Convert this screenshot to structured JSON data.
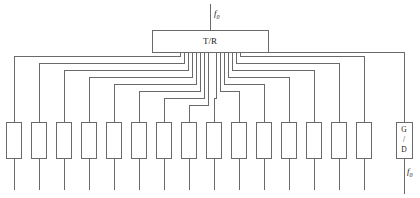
{
  "diagram": {
    "type": "block-diagram",
    "canvas": {
      "width": 420,
      "height": 198
    },
    "colors": {
      "line": "#6a6a6a",
      "box_fill": "#ffffff",
      "text": "#1a1a1a",
      "background": "#ffffff"
    }
  },
  "tr_module": {
    "label": "T/R",
    "x": 152,
    "y": 30,
    "width": 116,
    "height": 22
  },
  "input_port": {
    "label_base": "f",
    "label_sub": "0",
    "stem_x": 210,
    "stem_top": 4,
    "stem_bottom": 30,
    "text_x": 214,
    "text_y": 14
  },
  "output_port": {
    "label_base": "f",
    "label_sub": "0",
    "stem_x": 404,
    "stem_top": 158,
    "stem_bottom": 194,
    "text_x": 407,
    "text_y": 172
  },
  "gd_module": {
    "lines": [
      "G",
      "/",
      "D"
    ],
    "x": 396,
    "y": 122,
    "width": 16,
    "height": 36,
    "stem_top": 112,
    "center_x": 404
  },
  "modules": {
    "count": 15,
    "width": 15,
    "height": 36,
    "top": 122,
    "bottom": 158,
    "stub_bottom": 190,
    "centers": [
      14,
      39,
      64,
      89,
      114,
      139,
      164,
      189,
      214,
      239,
      264,
      289,
      314,
      339,
      364
    ]
  },
  "feed_network": {
    "description": "Symmetric nested corporate feed from T/R module bottom edge to each element module",
    "bus_y": 52,
    "left_branches": [
      {
        "drop_x": 180,
        "run_y": 56,
        "target_x": 14
      },
      {
        "drop_x": 184,
        "run_y": 63,
        "target_x": 39
      },
      {
        "drop_x": 188,
        "run_y": 70,
        "target_x": 64
      },
      {
        "drop_x": 192,
        "run_y": 77,
        "target_x": 89
      },
      {
        "drop_x": 196,
        "run_y": 84,
        "target_x": 114
      },
      {
        "drop_x": 200,
        "run_y": 91,
        "target_x": 139
      },
      {
        "drop_x": 204,
        "run_y": 98,
        "target_x": 164
      },
      {
        "drop_x": 208,
        "run_y": 105,
        "target_x": 189
      }
    ],
    "right_branches": [
      {
        "drop_x": 240,
        "run_y": 56,
        "target_x": 364
      },
      {
        "drop_x": 236,
        "run_y": 63,
        "target_x": 339
      },
      {
        "drop_x": 232,
        "run_y": 70,
        "target_x": 314
      },
      {
        "drop_x": 228,
        "run_y": 77,
        "target_x": 289
      },
      {
        "drop_x": 224,
        "run_y": 84,
        "target_x": 264
      },
      {
        "drop_x": 220,
        "run_y": 91,
        "target_x": 239
      },
      {
        "drop_x": 216,
        "run_y": 98,
        "target_x": 214
      }
    ],
    "gd_branch": {
      "drop_x": 244,
      "run_y": 52,
      "target_x": 404
    }
  }
}
